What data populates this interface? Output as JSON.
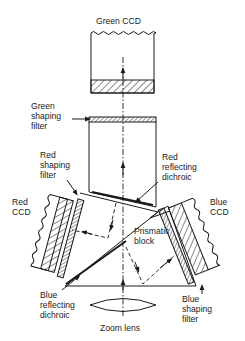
{
  "diagram": {
    "type": "optical-path",
    "labels": {
      "green_ccd": "Green CCD",
      "green_filter_1": "Green",
      "green_filter_2": "shaping",
      "green_filter_3": "filter",
      "red_dichroic_1": "Red",
      "red_dichroic_2": "reflecting",
      "red_dichroic_3": "dichroic",
      "red_filter_1": "Red",
      "red_filter_2": "shaping",
      "red_filter_3": "filter",
      "red_ccd_1": "Red",
      "red_ccd_2": "CCD",
      "blue_ccd_1": "Blue",
      "blue_ccd_2": "CCD",
      "prism_1": "Prismatic",
      "prism_2": "block",
      "blue_dichroic_1": "Blue",
      "blue_dichroic_2": "reflecting",
      "blue_dichroic_3": "dichroic",
      "blue_filter_1": "Blue",
      "blue_filter_2": "shaping",
      "blue_filter_3": "filter",
      "lens": "Zoom lens"
    },
    "colors": {
      "ink": "#1a1a1a",
      "background": "#ffffff"
    }
  }
}
